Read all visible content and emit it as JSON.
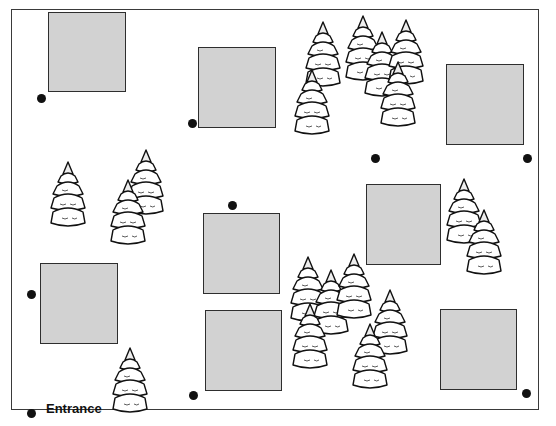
{
  "diagram": {
    "type": "site-map",
    "entrance_label": "Entrance",
    "colors": {
      "building_fill": "#d2d2d2",
      "building_border": "#2e2e2e",
      "marker": "#111111"
    },
    "buildings": [
      {
        "x": 48,
        "y": 12,
        "w": 78,
        "h": 80
      },
      {
        "x": 198,
        "y": 47,
        "w": 78,
        "h": 81
      },
      {
        "x": 446,
        "y": 64,
        "w": 78,
        "h": 81
      },
      {
        "x": 203,
        "y": 213,
        "w": 77,
        "h": 81
      },
      {
        "x": 366,
        "y": 184,
        "w": 75,
        "h": 81
      },
      {
        "x": 40,
        "y": 263,
        "w": 78,
        "h": 81
      },
      {
        "x": 205,
        "y": 310,
        "w": 77,
        "h": 81
      },
      {
        "x": 440,
        "y": 309,
        "w": 77,
        "h": 81
      }
    ],
    "markers": [
      {
        "x": 41,
        "y": 98
      },
      {
        "x": 192,
        "y": 123
      },
      {
        "x": 375,
        "y": 158
      },
      {
        "x": 527,
        "y": 158
      },
      {
        "x": 232,
        "y": 205
      },
      {
        "x": 31,
        "y": 294
      },
      {
        "x": 193,
        "y": 395
      },
      {
        "x": 526,
        "y": 393
      },
      {
        "x": 31,
        "y": 413
      }
    ],
    "trees": [
      {
        "x": 305,
        "y": 20,
        "s": 1.0
      },
      {
        "x": 345,
        "y": 14,
        "s": 1.0
      },
      {
        "x": 364,
        "y": 30,
        "s": 1.0
      },
      {
        "x": 388,
        "y": 18,
        "s": 1.0
      },
      {
        "x": 294,
        "y": 68,
        "s": 1.0
      },
      {
        "x": 380,
        "y": 60,
        "s": 1.0
      },
      {
        "x": 50,
        "y": 160,
        "s": 1.0
      },
      {
        "x": 128,
        "y": 148,
        "s": 1.0
      },
      {
        "x": 110,
        "y": 178,
        "s": 1.0
      },
      {
        "x": 446,
        "y": 177,
        "s": 1.0
      },
      {
        "x": 466,
        "y": 208,
        "s": 1.0
      },
      {
        "x": 290,
        "y": 255,
        "s": 1.0
      },
      {
        "x": 313,
        "y": 268,
        "s": 1.0
      },
      {
        "x": 336,
        "y": 252,
        "s": 1.0
      },
      {
        "x": 292,
        "y": 302,
        "s": 1.0
      },
      {
        "x": 372,
        "y": 288,
        "s": 1.0
      },
      {
        "x": 352,
        "y": 322,
        "s": 1.0
      },
      {
        "x": 112,
        "y": 346,
        "s": 1.0
      }
    ]
  }
}
